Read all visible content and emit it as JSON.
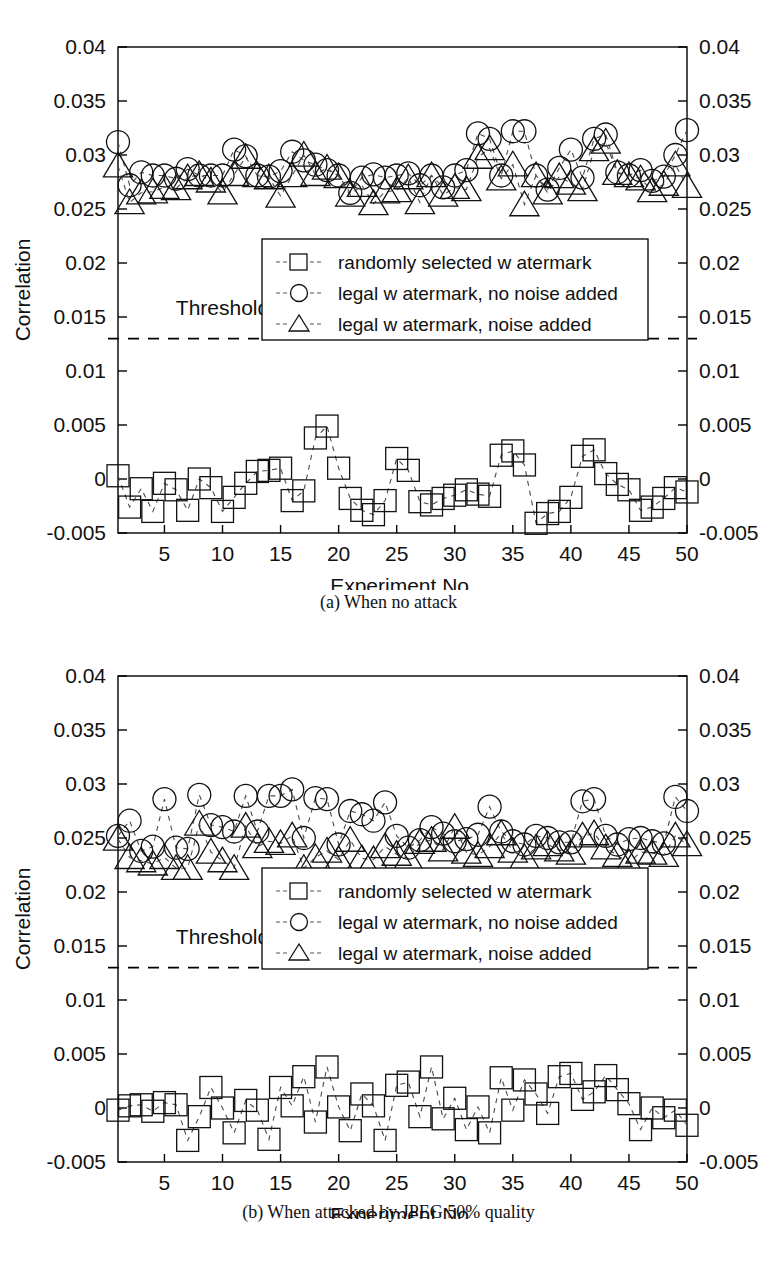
{
  "figure": {
    "panels": [
      {
        "id": "a",
        "caption": "(a) When no attack",
        "threshold_label": "Threshold",
        "axes": {
          "ylabel": "Correlation",
          "xlabel": "Experiment No.",
          "xticks": [
            5,
            10,
            15,
            20,
            25,
            30,
            35,
            40,
            45,
            50
          ],
          "xticklabels": [
            "5",
            "10",
            "15",
            "20",
            "25",
            "30",
            "35",
            "40",
            "45",
            "50"
          ],
          "yticks": [
            -0.005,
            0,
            0.005,
            0.01,
            0.015,
            0.02,
            0.025,
            0.03,
            0.035,
            0.04
          ],
          "yticklabels": [
            "-0.005",
            "0",
            "0.005",
            "0.01",
            "0.015",
            "0.02",
            "0.025",
            "0.03",
            "0.035",
            "0.04"
          ],
          "xlim": [
            1,
            50
          ],
          "ylim": [
            -0.005,
            0.04
          ],
          "grid": false
        },
        "legend": {
          "position": "center",
          "entries": [
            {
              "marker": "square",
              "label": "randomly selected w atermark"
            },
            {
              "marker": "circle",
              "label": "legal w atermark, no noise added"
            },
            {
              "marker": "triangle",
              "label": "legal w atermark, noise added"
            }
          ]
        }
      },
      {
        "id": "b",
        "caption": "(b) When attacked by JPEG 50% quality",
        "threshold_label": "Threshold",
        "axes": {
          "ylabel": "Correlation",
          "xlabel": "Experiment No.",
          "xticks": [
            5,
            10,
            15,
            20,
            25,
            30,
            35,
            40,
            45,
            50
          ],
          "xticklabels": [
            "5",
            "10",
            "15",
            "20",
            "25",
            "30",
            "35",
            "40",
            "45",
            "50"
          ],
          "yticks": [
            -0.005,
            0,
            0.005,
            0.01,
            0.015,
            0.02,
            0.025,
            0.03,
            0.035,
            0.04
          ],
          "yticklabels": [
            "-0.005",
            "0",
            "0.005",
            "0.01",
            "0.015",
            "0.02",
            "0.025",
            "0.03",
            "0.035",
            "0.04"
          ],
          "xlim": [
            1,
            50
          ],
          "ylim": [
            -0.005,
            0.04
          ],
          "grid": false
        },
        "legend": {
          "position": "center",
          "entries": [
            {
              "marker": "square",
              "label": "randomly selected w atermark"
            },
            {
              "marker": "circle",
              "label": "legal w atermark, no noise added"
            },
            {
              "marker": "triangle",
              "label": "legal w atermark, noise added"
            }
          ]
        }
      }
    ]
  },
  "chart_data": [
    {
      "type": "scatter",
      "title": "(a) When no attack",
      "xlabel": "Experiment No.",
      "ylabel": "Correlation",
      "xlim": [
        1,
        50
      ],
      "ylim": [
        -0.005,
        0.04
      ],
      "grid": false,
      "legend_position": "center",
      "annotations": [
        {
          "text": "Threshold",
          "x": 10,
          "y": 0.0152
        },
        {
          "type": "hline",
          "y": 0.013,
          "style": "dashed"
        }
      ],
      "x": [
        1,
        2,
        3,
        4,
        5,
        6,
        7,
        8,
        9,
        10,
        11,
        12,
        13,
        14,
        15,
        16,
        17,
        18,
        19,
        20,
        21,
        22,
        23,
        24,
        25,
        26,
        27,
        28,
        29,
        30,
        31,
        32,
        33,
        34,
        35,
        36,
        37,
        38,
        39,
        40,
        41,
        42,
        43,
        44,
        45,
        46,
        47,
        48,
        49,
        50
      ],
      "series": [
        {
          "name": "randomly selected w atermark",
          "marker": "square",
          "values": [
            0.0003,
            -0.0026,
            -0.0009,
            -0.003,
            -0.0004,
            -0.001,
            -0.0029,
            0.0,
            -0.0008,
            -0.003,
            -0.0017,
            -0.0004,
            0.0007,
            0.0008,
            0.001,
            -0.002,
            -0.0011,
            0.0038,
            0.0049,
            0.001,
            -0.0018,
            -0.0029,
            -0.0033,
            -0.002,
            0.0019,
            0.0008,
            -0.0021,
            -0.0024,
            -0.0018,
            -0.0015,
            -0.001,
            -0.0014,
            -0.0016,
            0.0022,
            0.0026,
            0.0013,
            -0.0041,
            -0.0032,
            -0.003,
            -0.0017,
            0.0021,
            0.0027,
            0.0005,
            -0.0005,
            -0.001,
            -0.0029,
            -0.0026,
            -0.0018,
            -0.0008,
            -0.0012
          ]
        },
        {
          "name": "legal w atermark, no noise added",
          "marker": "circle",
          "values": [
            0.0312,
            0.0272,
            0.0284,
            0.0281,
            0.0281,
            0.0278,
            0.0287,
            0.0281,
            0.0281,
            0.0281,
            0.0305,
            0.0299,
            0.0281,
            0.028,
            0.0285,
            0.0303,
            0.0295,
            0.0291,
            0.0286,
            0.0281,
            0.0265,
            0.0279,
            0.0282,
            0.0279,
            0.0281,
            0.0283,
            0.0272,
            0.0281,
            0.027,
            0.0281,
            0.0286,
            0.032,
            0.0315,
            0.0281,
            0.0322,
            0.0322,
            0.0281,
            0.0268,
            0.0288,
            0.0305,
            0.0279,
            0.0315,
            0.0319,
            0.0284,
            0.0281,
            0.0286,
            0.0276,
            0.028,
            0.03,
            0.0323
          ]
        },
        {
          "name": "legal w atermark, noise added",
          "marker": "triangle",
          "values": [
            0.029,
            0.0256,
            0.0265,
            0.0266,
            0.027,
            0.0269,
            0.0279,
            0.0282,
            0.0276,
            0.0265,
            0.0282,
            0.0298,
            0.0281,
            0.0279,
            0.0262,
            0.0281,
            0.03,
            0.0282,
            0.0288,
            0.028,
            0.0263,
            0.0272,
            0.0255,
            0.0266,
            0.0267,
            0.0279,
            0.0256,
            0.0281,
            0.0263,
            0.027,
            0.0268,
            0.0298,
            0.0306,
            0.0278,
            0.0291,
            0.0254,
            0.0281,
            0.0265,
            0.028,
            0.0274,
            0.0268,
            0.0305,
            0.0312,
            0.0283,
            0.0281,
            0.0278,
            0.0267,
            0.0273,
            0.0291,
            0.0271
          ]
        }
      ]
    },
    {
      "type": "scatter",
      "title": "(b) When attacked by JPEG 50% quality",
      "xlabel": "Experiment No.",
      "ylabel": "Correlation",
      "xlim": [
        1,
        50
      ],
      "ylim": [
        -0.005,
        0.04
      ],
      "grid": false,
      "legend_position": "center",
      "annotations": [
        {
          "text": "Threshold",
          "x": 10,
          "y": 0.0152
        },
        {
          "type": "hline",
          "y": 0.013,
          "style": "dashed"
        }
      ],
      "x": [
        1,
        2,
        3,
        4,
        5,
        6,
        7,
        8,
        9,
        10,
        11,
        12,
        13,
        14,
        15,
        16,
        17,
        18,
        19,
        20,
        21,
        22,
        23,
        24,
        25,
        26,
        27,
        28,
        29,
        30,
        31,
        32,
        33,
        34,
        35,
        36,
        37,
        38,
        39,
        40,
        41,
        42,
        43,
        44,
        45,
        46,
        47,
        48,
        49,
        50
      ],
      "series": [
        {
          "name": "randomly selected w atermark",
          "marker": "square",
          "values": [
            -0.0002,
            0.0002,
            0.0003,
            -0.0003,
            0.0005,
            0.0003,
            -0.003,
            -0.0008,
            0.0019,
            0.0,
            -0.0023,
            0.0007,
            -0.0002,
            -0.0029,
            0.0019,
            0.0002,
            0.0029,
            -0.0013,
            0.0038,
            0.0001,
            -0.0021,
            0.0013,
            0.0002,
            -0.003,
            0.0021,
            0.0024,
            -0.0008,
            0.0038,
            -0.001,
            0.0009,
            -0.002,
            0.0001,
            -0.0023,
            0.0028,
            -0.0002,
            0.0026,
            0.0013,
            -0.0005,
            0.0029,
            0.0032,
            0.0008,
            0.0015,
            0.003,
            0.0017,
            0.0004,
            -0.002,
            0.0,
            -0.0009,
            -0.0002,
            -0.0016
          ]
        },
        {
          "name": "legal w atermark, no noise added",
          "marker": "circle",
          "values": [
            0.0252,
            0.0266,
            0.0238,
            0.0242,
            0.0286,
            0.0241,
            0.024,
            0.029,
            0.0262,
            0.026,
            0.0256,
            0.0289,
            0.0256,
            0.0289,
            0.0289,
            0.0295,
            0.025,
            0.0287,
            0.0286,
            0.0244,
            0.0275,
            0.0272,
            0.0266,
            0.0283,
            0.0252,
            0.0241,
            0.0248,
            0.026,
            0.0254,
            0.0247,
            0.0249,
            0.0253,
            0.0279,
            0.0256,
            0.0247,
            0.0244,
            0.0252,
            0.025,
            0.0246,
            0.0246,
            0.0284,
            0.0286,
            0.0252,
            0.0244,
            0.0249,
            0.025,
            0.0247,
            0.0245,
            0.0288,
            0.0275
          ]
        },
        {
          "name": "legal w atermark, noise added",
          "marker": "triangle",
          "values": [
            0.0249,
            0.0232,
            0.0229,
            0.0226,
            0.0232,
            0.0222,
            0.0222,
            0.0263,
            0.0237,
            0.0229,
            0.0222,
            0.0261,
            0.0242,
            0.0247,
            0.0245,
            0.0252,
            0.0222,
            0.0232,
            0.0238,
            0.023,
            0.0248,
            0.0231,
            0.023,
            0.0242,
            0.0235,
            0.0231,
            0.0246,
            0.0248,
            0.0239,
            0.026,
            0.0237,
            0.0234,
            0.0242,
            0.0254,
            0.0238,
            0.0232,
            0.0241,
            0.0244,
            0.0239,
            0.0236,
            0.0252,
            0.0254,
            0.0241,
            0.0234,
            0.0227,
            0.0237,
            0.0236,
            0.0234,
            0.0252,
            0.0244
          ]
        }
      ]
    }
  ]
}
